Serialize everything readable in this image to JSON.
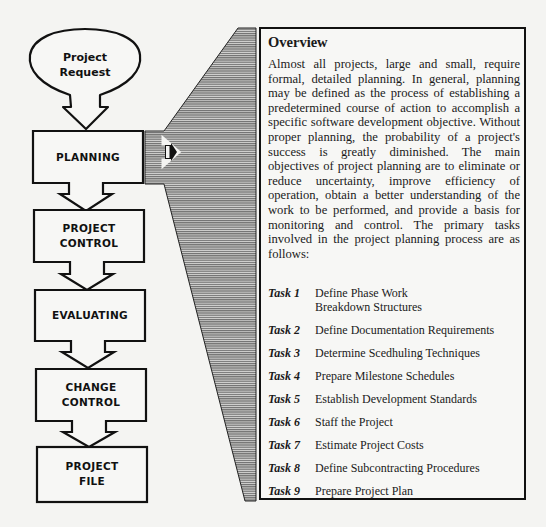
{
  "flowchart": {
    "start": {
      "label_line1": "Project",
      "label_line2": "Request"
    },
    "steps": [
      {
        "id": "planning",
        "line1": "PLANNING",
        "line2": ""
      },
      {
        "id": "project-control",
        "line1": "PROJECT",
        "line2": "CONTROL"
      },
      {
        "id": "evaluating",
        "line1": "EVALUATING",
        "line2": ""
      },
      {
        "id": "change-control",
        "line1": "CHANGE",
        "line2": "CONTROL"
      },
      {
        "id": "project-file",
        "line1": "PROJECT",
        "line2": "FILE"
      }
    ],
    "expanded_step": "PLANNING",
    "colors": {
      "stroke": "#111111",
      "shading": "#8a8a8a",
      "background": "#f4f4f2"
    }
  },
  "panel": {
    "title": "Overview",
    "body": "Almost all projects, large and small, require formal, detailed planning.  In general, planning may be defined as the process of establishing a predetermined course of action to accomplish a specific software development objective. Without proper planning, the probability of a project's success is greatly diminished.  The main objectives of project planning are to eliminate or reduce uncertainty, improve efficiency of operation, obtain a better understanding of the work to be performed, and provide a basis for monitoring and control.  The primary tasks involved in the project planning process are as follows:",
    "tasks": [
      {
        "label": "Task 1",
        "text": "Define Phase Work Breakdown Structures"
      },
      {
        "label": "Task 2",
        "text": "Define Documentation Requirements"
      },
      {
        "label": "Task 3",
        "text": "Determine Scedhuling Techniques"
      },
      {
        "label": "Task 4",
        "text": "Prepare Milestone Schedules"
      },
      {
        "label": "Task 5",
        "text": "Establish Development Standards"
      },
      {
        "label": "Task 6",
        "text": "Staff the Project"
      },
      {
        "label": "Task 7",
        "text": "Estimate Project Costs"
      },
      {
        "label": "Task 8",
        "text": "Define Subcontracting Procedures"
      },
      {
        "label": "Task 9",
        "text": "Prepare Project Plan"
      }
    ]
  }
}
